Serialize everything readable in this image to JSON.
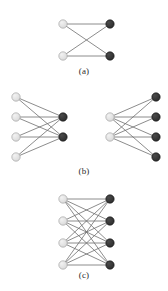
{
  "figure": {
    "background_color": "#ffffff",
    "node_colors": {
      "light": "#d9d9d9",
      "light_edge": "#9a9a9a",
      "dark": "#2b2b2b",
      "dark_edge": "#111111"
    },
    "edge_color": "#6e6e6e",
    "edge_width": 0.8,
    "node_radius": 4.2
  },
  "panels": [
    {
      "id": "a",
      "caption": "(a)",
      "graphs": [
        {
          "name": "K2,2",
          "left_count": 2,
          "right_count": 2,
          "left_nodes": [
            {
              "id": "L1",
              "x": 63,
              "y": 10,
              "color": "light"
            },
            {
              "id": "L2",
              "x": 63,
              "y": 42,
              "color": "light"
            }
          ],
          "right_nodes": [
            {
              "id": "R1",
              "x": 110,
              "y": 10,
              "color": "dark"
            },
            {
              "id": "R2",
              "x": 110,
              "y": 42,
              "color": "dark"
            }
          ],
          "edges": [
            [
              "L1",
              "R1"
            ],
            [
              "L1",
              "R2"
            ],
            [
              "L2",
              "R1"
            ],
            [
              "L2",
              "R2"
            ]
          ]
        }
      ]
    },
    {
      "id": "b",
      "caption": "(b)",
      "graphs": [
        {
          "name": "K4,2",
          "left_count": 4,
          "right_count": 2,
          "left_nodes": [
            {
              "id": "L1",
              "x": 16,
              "y": 9,
              "color": "light"
            },
            {
              "id": "L2",
              "x": 16,
              "y": 29,
              "color": "light"
            },
            {
              "id": "L3",
              "x": 16,
              "y": 49,
              "color": "light"
            },
            {
              "id": "L4",
              "x": 16,
              "y": 69,
              "color": "light"
            }
          ],
          "right_nodes": [
            {
              "id": "R1",
              "x": 63,
              "y": 29,
              "color": "dark"
            },
            {
              "id": "R2",
              "x": 63,
              "y": 49,
              "color": "dark"
            }
          ],
          "edges": [
            [
              "L1",
              "R1"
            ],
            [
              "L1",
              "R2"
            ],
            [
              "L2",
              "R1"
            ],
            [
              "L2",
              "R2"
            ],
            [
              "L3",
              "R1"
            ],
            [
              "L3",
              "R2"
            ],
            [
              "L4",
              "R1"
            ],
            [
              "L4",
              "R2"
            ]
          ]
        },
        {
          "name": "K2,4",
          "left_count": 2,
          "right_count": 4,
          "left_nodes": [
            {
              "id": "L1",
              "x": 110,
              "y": 29,
              "color": "light"
            },
            {
              "id": "L2",
              "x": 110,
              "y": 49,
              "color": "light"
            }
          ],
          "right_nodes": [
            {
              "id": "R1",
              "x": 156,
              "y": 9,
              "color": "dark"
            },
            {
              "id": "R2",
              "x": 156,
              "y": 29,
              "color": "dark"
            },
            {
              "id": "R3",
              "x": 156,
              "y": 49,
              "color": "dark"
            },
            {
              "id": "R4",
              "x": 156,
              "y": 69,
              "color": "dark"
            }
          ],
          "edges": [
            [
              "L1",
              "R1"
            ],
            [
              "L1",
              "R2"
            ],
            [
              "L1",
              "R3"
            ],
            [
              "L1",
              "R4"
            ],
            [
              "L2",
              "R1"
            ],
            [
              "L2",
              "R2"
            ],
            [
              "L2",
              "R3"
            ],
            [
              "L2",
              "R4"
            ]
          ]
        }
      ]
    },
    {
      "id": "c",
      "caption": "(c)",
      "graphs": [
        {
          "name": "K4,4",
          "left_count": 4,
          "right_count": 4,
          "left_nodes": [
            {
              "id": "L1",
              "x": 63,
              "y": 9,
              "color": "light"
            },
            {
              "id": "L2",
              "x": 63,
              "y": 31,
              "color": "light"
            },
            {
              "id": "L3",
              "x": 63,
              "y": 53,
              "color": "light"
            },
            {
              "id": "L4",
              "x": 63,
              "y": 75,
              "color": "light"
            }
          ],
          "right_nodes": [
            {
              "id": "R1",
              "x": 110,
              "y": 9,
              "color": "dark"
            },
            {
              "id": "R2",
              "x": 110,
              "y": 31,
              "color": "dark"
            },
            {
              "id": "R3",
              "x": 110,
              "y": 53,
              "color": "dark"
            },
            {
              "id": "R4",
              "x": 110,
              "y": 75,
              "color": "dark"
            }
          ],
          "edges": [
            [
              "L1",
              "R1"
            ],
            [
              "L1",
              "R2"
            ],
            [
              "L1",
              "R3"
            ],
            [
              "L1",
              "R4"
            ],
            [
              "L2",
              "R1"
            ],
            [
              "L2",
              "R2"
            ],
            [
              "L2",
              "R3"
            ],
            [
              "L2",
              "R4"
            ],
            [
              "L3",
              "R1"
            ],
            [
              "L3",
              "R2"
            ],
            [
              "L3",
              "R3"
            ],
            [
              "L3",
              "R4"
            ],
            [
              "L4",
              "R1"
            ],
            [
              "L4",
              "R2"
            ],
            [
              "L4",
              "R3"
            ],
            [
              "L4",
              "R4"
            ]
          ]
        }
      ]
    }
  ]
}
